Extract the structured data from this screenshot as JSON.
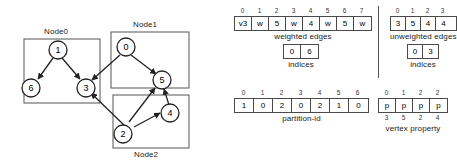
{
  "diagram": {
    "title_kind": "graph-partition-and-csr-arrays",
    "node_boxes": [
      {
        "id": "node0",
        "label": "Node0",
        "label_pos": "top"
      },
      {
        "id": "node1",
        "label": "Node1",
        "label_pos": "top"
      },
      {
        "id": "node2",
        "label": "Node2",
        "label_pos": "bottom"
      }
    ],
    "vertices": [
      {
        "id": "v1",
        "label": "1",
        "box": "node0"
      },
      {
        "id": "v6",
        "label": "6",
        "box": "node0"
      },
      {
        "id": "v3",
        "label": "3",
        "box": "node0"
      },
      {
        "id": "v0",
        "label": "0",
        "box": "node1"
      },
      {
        "id": "v5",
        "label": "5",
        "box": "node1"
      },
      {
        "id": "v4",
        "label": "4",
        "box": "node2"
      },
      {
        "id": "v2",
        "label": "2",
        "box": "node2"
      }
    ],
    "edges": [
      {
        "from": "1",
        "to": "6"
      },
      {
        "from": "1",
        "to": "3"
      },
      {
        "from": "0",
        "to": "3"
      },
      {
        "from": "0",
        "to": "5"
      },
      {
        "from": "2",
        "to": "3"
      },
      {
        "from": "2",
        "to": "5"
      },
      {
        "from": "2",
        "to": "4"
      },
      {
        "from": "4",
        "to": "5"
      }
    ]
  },
  "arrays": {
    "weighted_edges": {
      "caption": "weighted edges",
      "indices": [
        "0",
        "1",
        "2",
        "3",
        "4",
        "5",
        "6",
        "7"
      ],
      "values": [
        "v3",
        "w",
        "5",
        "w",
        "4",
        "w",
        "5",
        "w"
      ]
    },
    "weighted_indices": {
      "caption": "indices",
      "values": [
        "0",
        "6"
      ]
    },
    "unweighted_edges": {
      "caption": "unweighted edges",
      "indices": [
        "0",
        "1",
        "2",
        "3"
      ],
      "values": [
        "3",
        "5",
        "4",
        "4"
      ]
    },
    "unweighted_indices": {
      "caption": "indices",
      "values": [
        "0",
        "3"
      ]
    },
    "partition_id": {
      "caption": "partition-id",
      "indices": [
        "0",
        "1",
        "2",
        "3",
        "4",
        "5",
        "6"
      ],
      "values": [
        "1",
        "0",
        "2",
        "0",
        "2",
        "1",
        "0"
      ]
    },
    "vertex_property": {
      "caption": "vertex property",
      "indices": [
        "0",
        "1",
        "2",
        "2"
      ],
      "values": [
        "p",
        "p",
        "p",
        "p"
      ],
      "subscripts": [
        "3",
        "5",
        "2",
        "4"
      ]
    }
  },
  "colors": {
    "stroke": "#333333",
    "cell_border": "#4a4a4a",
    "box_border": "#555555",
    "text": "#1a1a1a",
    "background": "#ffffff"
  }
}
